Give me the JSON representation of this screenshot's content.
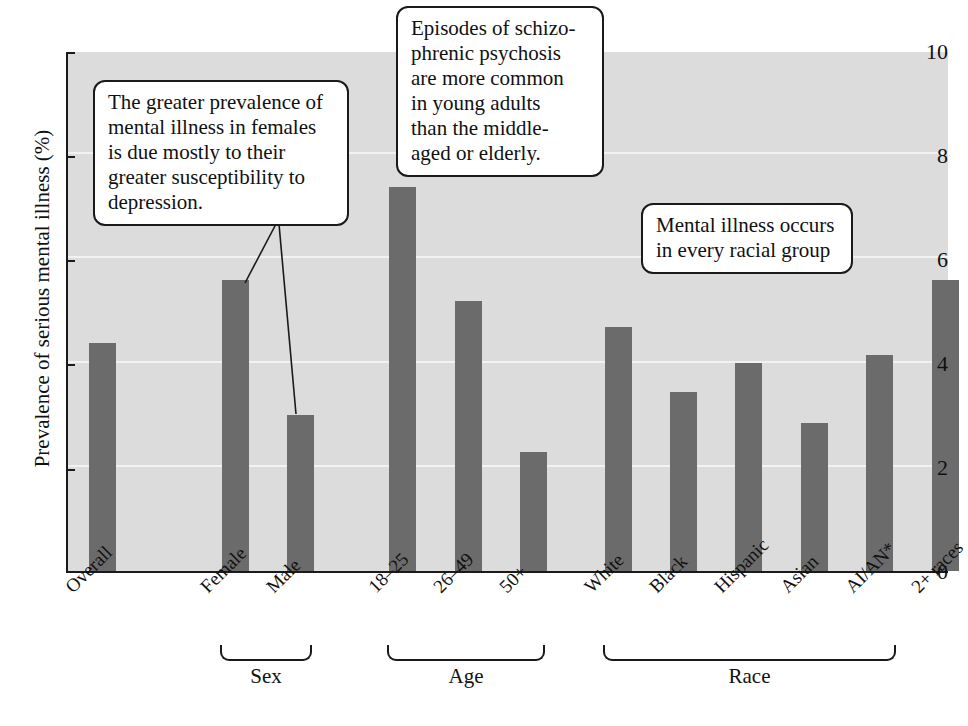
{
  "chart_data": {
    "type": "bar",
    "title": "",
    "xlabel": "",
    "ylabel": "Prevalence of serious mental illness (%)",
    "ylim": [
      0,
      10
    ],
    "ytick_values": [
      0,
      2,
      4,
      6,
      8,
      10
    ],
    "ytick_labels": [
      "0",
      "2",
      "4",
      "6",
      "8",
      "10"
    ],
    "grid": "horizontal",
    "legend": "none",
    "categories": [
      "Overall",
      "Female",
      "Male",
      "18–25",
      "26–49",
      "50+",
      "White",
      "Black",
      "Hispanic",
      "Asian",
      "AI/AN*",
      "2+ races"
    ],
    "values": [
      4.4,
      5.6,
      3.0,
      7.4,
      5.2,
      2.3,
      4.7,
      3.45,
      4.0,
      2.85,
      4.17,
      5.6
    ],
    "bar_color": "#6b6b6b",
    "plot_background": "#dcdcdc",
    "groups": [
      {
        "label": "Sex",
        "categories": [
          "Female",
          "Male"
        ]
      },
      {
        "label": "Age",
        "categories": [
          "18–25",
          "26–49",
          "50+"
        ]
      },
      {
        "label": "Race",
        "categories": [
          "White",
          "Black",
          "Hispanic",
          "Asian",
          "AI/AN*",
          "2+ races"
        ]
      }
    ],
    "annotations": [
      {
        "id": "sex-callout",
        "text": "The greater prevalence of mental illness in females is due mostly to their greater susceptibility to depression.",
        "lines": [
          "The greater prevalence of",
          "mental illness in females",
          "is due mostly to their",
          "greater susceptibility to",
          "depression."
        ],
        "points_to": [
          "Female",
          "Male"
        ]
      },
      {
        "id": "age-callout",
        "text": "Episodes of schizophrenic psychosis are more common in young adults than the middle-aged or elderly.",
        "lines": [
          "Episodes of schizo-",
          "phrenic psychosis",
          "are more common",
          "in young adults",
          "than the middle-",
          "aged or elderly."
        ],
        "points_to": []
      },
      {
        "id": "race-callout",
        "text": "Mental illness occurs in every racial group",
        "lines": [
          "Mental illness occurs",
          "in every racial group"
        ],
        "points_to": []
      }
    ]
  },
  "axis": {
    "y_title": "Prevalence of serious mental illness (%)",
    "ticks": [
      "10",
      "8",
      "6",
      "4",
      "2",
      "0"
    ]
  },
  "x_labels": {
    "overall": "Overall",
    "female": "Female",
    "male": "Male",
    "age_18_25": "18–25",
    "age_26_49": "26–49",
    "age_50_plus": "50+",
    "white": "White",
    "black": "Black",
    "hispanic": "Hispanic",
    "asian": "Asian",
    "ai_an": "AI/AN*",
    "two_plus": "2+ races"
  },
  "group_labels": {
    "sex": "Sex",
    "age": "Age",
    "race": "Race"
  },
  "callouts": {
    "sex": {
      "l1": "The greater prevalence of",
      "l2": "mental illness in females",
      "l3": "is due mostly to their",
      "l4": "greater susceptibility to",
      "l5": "depression."
    },
    "age": {
      "l1": "Episodes of schizo-",
      "l2": "phrenic psychosis",
      "l3": "are more common",
      "l4": "in young adults",
      "l5": "than the middle-",
      "l6": "aged or elderly."
    },
    "race": {
      "l1": "Mental illness occurs",
      "l2": "in every racial group"
    }
  }
}
